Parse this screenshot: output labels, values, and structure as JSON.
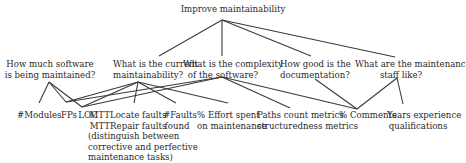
{
  "diagram": {
    "title": "Improve maintainability",
    "questions": [
      {
        "id": "q1",
        "lines": [
          "How much software",
          "is being maintained?"
        ]
      },
      {
        "id": "q2",
        "lines": [
          "What is the current",
          "maintainability?"
        ]
      },
      {
        "id": "q3",
        "lines": [
          "What is the complexity",
          "of the software?"
        ]
      },
      {
        "id": "q4",
        "lines": [
          "How good is the",
          "documentation?"
        ]
      },
      {
        "id": "q5",
        "lines": [
          "What are the maintenance",
          "staff like?"
        ]
      }
    ],
    "metrics": [
      {
        "id": "modules",
        "lines": [
          "#Modules"
        ]
      },
      {
        "id": "fps",
        "lines": [
          "FPs"
        ]
      },
      {
        "id": "loc",
        "lines": [
          "LOC"
        ]
      },
      {
        "id": "mtt",
        "lines": [
          "MTTLocate faults",
          "MTTRepair faults",
          "(distinguish between",
          "corrective and perfective",
          "maintenance tasks)"
        ]
      },
      {
        "id": "faults",
        "lines": [
          "#Faults",
          "found"
        ]
      },
      {
        "id": "effort",
        "lines": [
          "% Effort spent",
          "on maintenance"
        ]
      },
      {
        "id": "paths",
        "lines": [
          "Paths count metrics",
          "structuredness metrics"
        ]
      },
      {
        "id": "comments",
        "lines": [
          "% Comments"
        ]
      },
      {
        "id": "years",
        "lines": [
          "Years experience",
          "qualifications"
        ]
      }
    ],
    "edges": [
      [
        "goal",
        "q2"
      ],
      [
        "goal",
        "q3"
      ],
      [
        "goal",
        "q4"
      ],
      [
        "goal",
        "q5"
      ],
      [
        "q1",
        "modules"
      ],
      [
        "q1",
        "fps"
      ],
      [
        "q1",
        "loc"
      ],
      [
        "q2",
        "fps"
      ],
      [
        "q2",
        "loc"
      ],
      [
        "q2",
        "mtt"
      ],
      [
        "q2",
        "faults"
      ],
      [
        "q2",
        "effort"
      ],
      [
        "q3",
        "fps"
      ],
      [
        "q3",
        "loc"
      ],
      [
        "q3",
        "paths"
      ],
      [
        "q3",
        "comments"
      ],
      [
        "q4",
        "comments"
      ],
      [
        "q5",
        "comments"
      ],
      [
        "q5",
        "years"
      ]
    ]
  }
}
